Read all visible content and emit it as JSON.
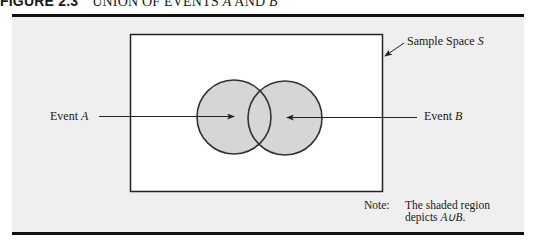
{
  "figure": {
    "number": "FIGURE 2.3",
    "title_prefix": "UNION OF EVENTS ",
    "title_a": "A",
    "title_mid": " AND ",
    "title_b": "B"
  },
  "diagram": {
    "sample_space_label": "Sample Space ",
    "sample_space_var": "S",
    "event_a_label": "Event ",
    "event_a_var": "A",
    "event_b_label": "Event ",
    "event_b_var": "B",
    "shade_color": "#d6d6d6",
    "panel_color": "#efefef"
  },
  "note": {
    "label": "Note:",
    "line1": "The shaded region",
    "line2_prefix": "depicts ",
    "line2_expr": "A∪B",
    "line2_suffix": "."
  }
}
